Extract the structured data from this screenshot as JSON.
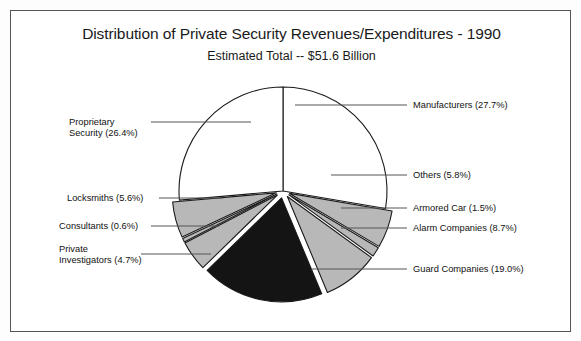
{
  "page": {
    "background": "#fdfdfd",
    "frame_color": "#555555"
  },
  "header": {
    "title": "Distribution of Private Security Revenues/Expenditures - 1990",
    "subtitle": "Estimated Total -- $51.6 Billion"
  },
  "colors": {
    "slice_gray": "#b8b8b8",
    "slice_black": "#141414",
    "slice_white": "#ffffff",
    "outline": "#1a1a1a",
    "leader_line": "#555555",
    "text": "#111111"
  },
  "labels": {
    "manufacturers": "Manufacturers (27.7%)",
    "others": "Others (5.8%)",
    "armored_car": "Armored Car (1.5%)",
    "alarm_companies": "Alarm Companies (8.7%)",
    "guard_companies": "Guard Companies (19.0%)",
    "proprietary_security": "Proprietary\nSecurity (26.4%)",
    "locksmiths": "Locksmiths (5.6%)",
    "consultants": "Consultants (0.6%)",
    "private_investigators": "Private\nInvestigators (4.7%)"
  },
  "chart_data": {
    "type": "pie",
    "title": "Distribution of Private Security Revenues/Expenditures - 1990",
    "subtitle": "Estimated Total -- $51.6 Billion",
    "total_label": "Estimated Total -- $51.6 Billion",
    "total_value": 51.6,
    "total_units": "billion USD",
    "value_unit": "percent",
    "legend": "callout-labels",
    "grid": false,
    "categories": [
      "Manufacturers",
      "Others",
      "Armored Car",
      "Alarm Companies",
      "Guard Companies",
      "Private Investigators",
      "Consultants",
      "Locksmiths",
      "Proprietary Security"
    ],
    "values": [
      27.7,
      5.8,
      1.5,
      8.7,
      19.0,
      4.7,
      0.6,
      5.6,
      26.4
    ],
    "slices": [
      {
        "name": "Manufacturers",
        "value": 27.7,
        "label": "Manufacturers (27.7%)",
        "fill": "#ffffff"
      },
      {
        "name": "Others",
        "value": 5.8,
        "label": "Others (5.8%)",
        "fill": "#b8b8b8"
      },
      {
        "name": "Armored Car",
        "value": 1.5,
        "label": "Armored Car (1.5%)",
        "fill": "#b8b8b8"
      },
      {
        "name": "Alarm Companies",
        "value": 8.7,
        "label": "Alarm Companies (8.7%)",
        "fill": "#b8b8b8"
      },
      {
        "name": "Guard Companies",
        "value": 19.0,
        "label": "Guard Companies (19.0%)",
        "fill": "#141414"
      },
      {
        "name": "Private Investigators",
        "value": 4.7,
        "label": "Private Investigators (4.7%)",
        "fill": "#b8b8b8"
      },
      {
        "name": "Consultants",
        "value": 0.6,
        "label": "Consultants (0.6%)",
        "fill": "#b8b8b8"
      },
      {
        "name": "Locksmiths",
        "value": 5.6,
        "label": "Locksmiths (5.6%)",
        "fill": "#b8b8b8"
      },
      {
        "name": "Proprietary Security",
        "value": 26.4,
        "label": "Proprietary Security (26.4%)",
        "fill": "#ffffff"
      }
    ]
  }
}
